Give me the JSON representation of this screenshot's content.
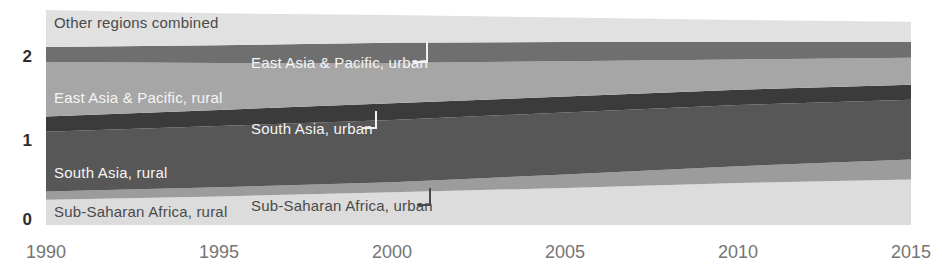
{
  "chart_data": {
    "type": "area",
    "stacked": true,
    "title": "",
    "xlabel": "",
    "ylabel": "",
    "grid": false,
    "legend_position": "inline-band-labels",
    "x": [
      1990,
      1995,
      2000,
      2005,
      2010,
      2015
    ],
    "x_tick_labels": [
      "1990",
      "1995",
      "2000",
      "2005",
      "2010",
      "2015"
    ],
    "y_tick_values": [
      0,
      1,
      2
    ],
    "y_tick_labels": [
      "0",
      "1",
      "2"
    ],
    "ylim": [
      0,
      2.68
    ],
    "series": [
      {
        "id": "sub-saharan-africa-rural",
        "name": "Sub-Saharan Africa, rural",
        "values": [
          0.3,
          0.34,
          0.39,
          0.44,
          0.5,
          0.54
        ],
        "color": "#dcdcdc",
        "label_color": "#4a4a4a"
      },
      {
        "id": "sub-saharan-africa-urban",
        "name": "Sub-Saharan Africa, urban",
        "values": [
          0.1,
          0.11,
          0.12,
          0.16,
          0.2,
          0.24
        ],
        "color": "#9c9c9c",
        "label_color": "#4a4a4a"
      },
      {
        "id": "south-asia-rural",
        "name": "South Asia, rural",
        "values": [
          0.71,
          0.73,
          0.74,
          0.74,
          0.73,
          0.71
        ],
        "color": "#575757",
        "label_color": "#f5f5f5"
      },
      {
        "id": "south-asia-urban",
        "name": "South Asia, urban",
        "values": [
          0.18,
          0.19,
          0.2,
          0.19,
          0.18,
          0.18
        ],
        "color": "#3b3b3b",
        "label_color": "#f5f5f5"
      },
      {
        "id": "east-asia-pacific-rural",
        "name": "East Asia & Pacific, rural",
        "values": [
          0.65,
          0.56,
          0.48,
          0.42,
          0.36,
          0.32
        ],
        "color": "#a6a6a6",
        "label_color": "#f5f5f5"
      },
      {
        "id": "east-asia-pacific-urban",
        "name": "East Asia & Pacific, urban",
        "values": [
          0.18,
          0.21,
          0.24,
          0.23,
          0.21,
          0.19
        ],
        "color": "#6f6f6f",
        "label_color": "#f5f5f5"
      },
      {
        "id": "other-regions-combined",
        "name": "Other regions combined",
        "values": [
          0.44,
          0.38,
          0.33,
          0.29,
          0.26,
          0.24
        ],
        "color": "#e1e1e1",
        "label_color": "#4a4a4a"
      }
    ]
  }
}
